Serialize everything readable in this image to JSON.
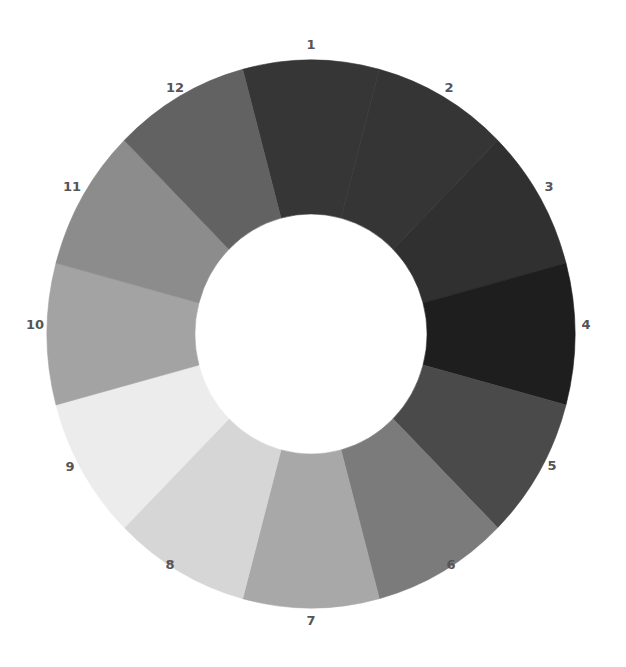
{
  "chart_data": {
    "type": "pie",
    "variant": "donut",
    "title": "",
    "center": [
      311,
      334
    ],
    "outer_radius": [
      264,
      274
    ],
    "inner_radius": [
      116,
      120
    ],
    "start_angle_deg": -15,
    "categories": [
      "1",
      "2",
      "3",
      "4",
      "5",
      "6",
      "7",
      "8",
      "9",
      "10",
      "11",
      "12"
    ],
    "values": [
      1,
      1,
      1,
      1,
      1,
      1,
      1,
      1,
      1,
      1,
      1,
      1
    ],
    "colors": [
      "#363636",
      "#353535",
      "#303030",
      "#1e1e1e",
      "#4a4a4a",
      "#7b7b7b",
      "#a8a8a8",
      "#d6d6d6",
      "#ececec",
      "#a3a3a3",
      "#8c8c8c",
      "#626262"
    ],
    "label_positions": [
      [
        311,
        44
      ],
      [
        449,
        87
      ],
      [
        549,
        186
      ],
      [
        586,
        324
      ],
      [
        552,
        465
      ],
      [
        451,
        564
      ],
      [
        311,
        620
      ],
      [
        170,
        564
      ],
      [
        70,
        466
      ],
      [
        35,
        324
      ],
      [
        72,
        186
      ],
      [
        175,
        87
      ]
    ],
    "legend": "none"
  },
  "segments": [
    {
      "label": "1"
    },
    {
      "label": "2"
    },
    {
      "label": "3"
    },
    {
      "label": "4"
    },
    {
      "label": "5"
    },
    {
      "label": "6"
    },
    {
      "label": "7"
    },
    {
      "label": "8"
    },
    {
      "label": "9"
    },
    {
      "label": "10"
    },
    {
      "label": "11"
    },
    {
      "label": "12"
    }
  ]
}
